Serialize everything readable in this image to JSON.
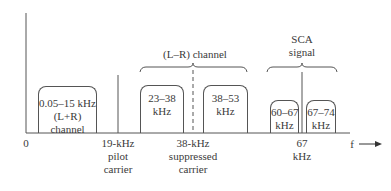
{
  "figure": {
    "axis": {
      "origin_label": "0",
      "x_label": "f",
      "x_arrow": "→"
    },
    "bands": [
      {
        "id": "lpr",
        "lines": [
          "0.05–15 kHz",
          "(L+R)",
          "channel"
        ]
      },
      {
        "id": "lsb",
        "lines": [
          "23–38",
          "kHz"
        ]
      },
      {
        "id": "usb",
        "lines": [
          "38–53",
          "kHz"
        ]
      },
      {
        "id": "sca_low",
        "lines": [
          "60–67",
          "kHz"
        ]
      },
      {
        "id": "sca_high",
        "lines": [
          "67–74",
          "kHz"
        ]
      }
    ],
    "markers": [
      {
        "id": "pilot",
        "lines": [
          "19-kHz",
          "pilot",
          "carrier"
        ],
        "style": "solid"
      },
      {
        "id": "suppressed",
        "lines": [
          "38-kHz",
          "suppressed",
          "carrier"
        ],
        "style": "dashed"
      },
      {
        "id": "sca_carrier",
        "lines": [
          "67",
          "kHz"
        ],
        "style": "solid"
      }
    ],
    "groups": [
      {
        "id": "lmr",
        "label": "(L–R) channel"
      },
      {
        "id": "sca",
        "lines": [
          "SCA",
          "signal"
        ]
      }
    ],
    "colors": {
      "line": "#555555",
      "text": "#3a3a3a"
    }
  }
}
